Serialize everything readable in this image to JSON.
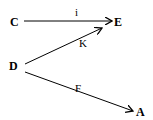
{
  "nodes": {
    "C": {
      "label": "C"
    },
    "E": {
      "label": "E"
    },
    "D": {
      "label": "D"
    },
    "A": {
      "label": "A"
    }
  },
  "edges": [
    {
      "from": "C",
      "to": "E",
      "label": "i"
    },
    {
      "from": "D",
      "to": "E",
      "label": "K"
    },
    {
      "from": "D",
      "to": "A",
      "label": "F"
    }
  ]
}
